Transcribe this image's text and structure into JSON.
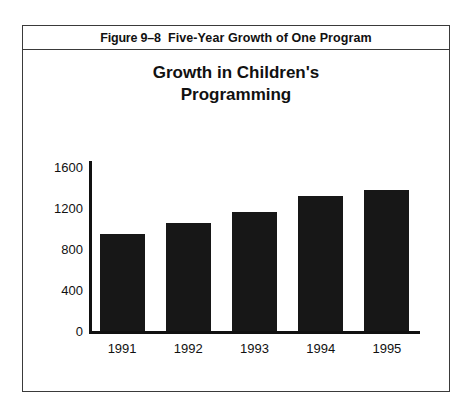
{
  "figure": {
    "caption_prefix": "Figure 9–8",
    "caption_text": "Five-Year Growth of One Program",
    "caption_full": "Figure 9–8  Five-Year Growth of One Program"
  },
  "chart_data": {
    "type": "bar",
    "title": "Growth in Children's Programming",
    "title_lines": [
      "Growth in Children's",
      "Programming"
    ],
    "categories": [
      "1991",
      "1992",
      "1993",
      "1994",
      "1995"
    ],
    "values": [
      950,
      1050,
      1160,
      1320,
      1380
    ],
    "xlabel": "",
    "ylabel": "",
    "ylim": [
      0,
      1600
    ],
    "yticks": [
      0,
      400,
      800,
      1200,
      1600
    ],
    "ytick_labels": [
      "0",
      "400",
      "800",
      "1200",
      "1600"
    ],
    "grid": false,
    "legend": false,
    "bar_color": "#171717",
    "axis_color": "#111111"
  },
  "colors": {
    "frame": "#3a3a3a",
    "bar": "#171717",
    "text": "#111111",
    "background": "#ffffff"
  }
}
